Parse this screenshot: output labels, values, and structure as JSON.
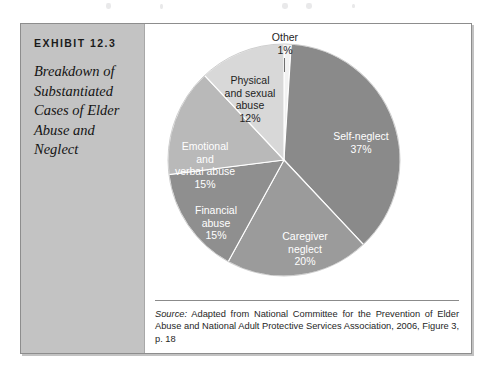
{
  "exhibit": {
    "label": "EXHIBIT 12.3",
    "title": "Breakdown of Substantiated Cases of Elder Abuse and Neglect"
  },
  "source": {
    "label": "Source:",
    "text": " Adapted from National Committee for the Prevention of Elder Abuse and National Adult Protective Services Association, 2006, Figure 3, p. 18"
  },
  "chart_data": {
    "type": "pie",
    "title": "Breakdown of Substantiated Cases of Elder Abuse and Neglect",
    "units": "percent",
    "start_angle_deg": 0,
    "direction": "clockwise",
    "legend": "none (labels drawn on slices)",
    "categories": [
      "Other",
      "Self-neglect",
      "Caregiver neglect",
      "Financial abuse",
      "Emotional and verbal abuse",
      "Physical and sexual abuse"
    ],
    "values": [
      1,
      37,
      20,
      15,
      15,
      12
    ],
    "colors": [
      "#f2f2f2",
      "#8a8a8a",
      "#9b9b9b",
      "#8f8f8f",
      "#b9b9b9",
      "#d8d8d8"
    ],
    "slices": [
      {
        "name": "Other",
        "label": "Other",
        "label_line_2": "",
        "label_line_3": "",
        "percent_text": "1%",
        "value": 1,
        "color": "#f2f2f2",
        "text_color": "dark",
        "label_position": "outside-top"
      },
      {
        "name": "Self-neglect",
        "label": "Self-neglect",
        "label_line_2": "",
        "label_line_3": "",
        "percent_text": "37%",
        "value": 37,
        "color": "#8a8a8a",
        "text_color": "light",
        "label_position": "inside-right"
      },
      {
        "name": "Caregiver neglect",
        "label": "Caregiver",
        "label_line_2": "neglect",
        "label_line_3": "",
        "percent_text": "20%",
        "value": 20,
        "color": "#9b9b9b",
        "text_color": "light",
        "label_position": "inside-bottom"
      },
      {
        "name": "Financial abuse",
        "label": "Financial",
        "label_line_2": "abuse",
        "label_line_3": "",
        "percent_text": "15%",
        "value": 15,
        "color": "#8f8f8f",
        "text_color": "light",
        "label_position": "inside-bottom-left"
      },
      {
        "name": "Emotional and verbal abuse",
        "label": "Emotional",
        "label_line_2": "and",
        "label_line_3": "verbal abuse",
        "percent_text": "15%",
        "value": 15,
        "color": "#b9b9b9",
        "text_color": "light",
        "label_position": "inside-left"
      },
      {
        "name": "Physical and sexual abuse",
        "label": "Physical",
        "label_line_2": "and sexual",
        "label_line_3": "abuse",
        "percent_text": "12%",
        "value": 12,
        "color": "#d8d8d8",
        "text_color": "dark",
        "label_position": "inside-top"
      }
    ]
  }
}
